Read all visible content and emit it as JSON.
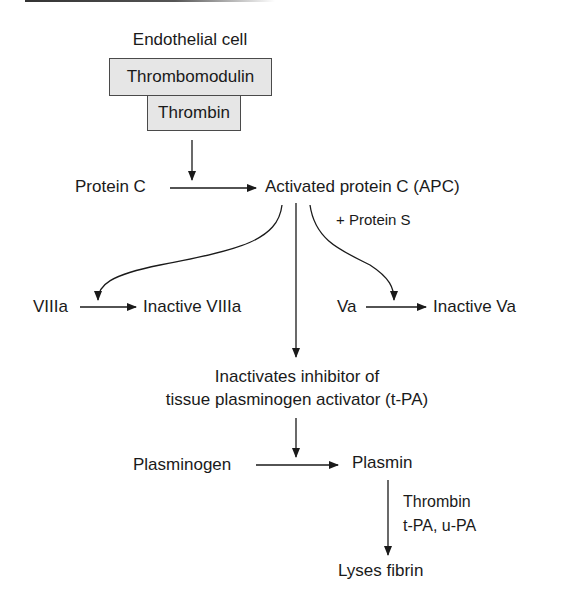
{
  "diagram": {
    "title_label": "Endothelial cell",
    "complex": {
      "top_box": "Thrombomodulin",
      "bottom_box": "Thrombin"
    },
    "activation": {
      "substrate": "Protein C",
      "product": "Activated protein C (APC)"
    },
    "cofactor": "+ Protein S",
    "branch_left": {
      "substrate": "VIIIa",
      "product": "Inactive VIIIa"
    },
    "branch_right": {
      "substrate": "Va",
      "product": "Inactive Va"
    },
    "center_effect": {
      "line1": "Inactivates inhibitor of",
      "line2": "tissue plasminogen activator (t-PA)"
    },
    "fibrinolysis": {
      "substrate": "Plasminogen",
      "product": "Plasmin",
      "activators_line1": "Thrombin",
      "activators_line2": "t-PA, u-PA",
      "outcome": "Lyses fibrin"
    },
    "colors": {
      "box_fill": "#e6e6e6",
      "line": "#1a1a1a"
    }
  }
}
